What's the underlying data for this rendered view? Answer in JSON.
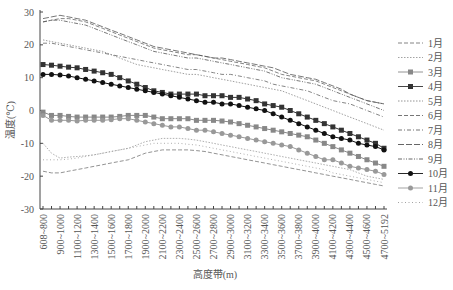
{
  "chart_data": {
    "type": "line",
    "title": "",
    "xlabel": "高度带(m)",
    "ylabel": "温度(℃)",
    "ylim": [
      -30,
      30
    ],
    "yticks": [
      30,
      20,
      10,
      0,
      -10,
      -20,
      -30
    ],
    "grid": false,
    "legend_position": "right",
    "categories": [
      "608~800",
      "800~900",
      "900~1000",
      "1000~1100",
      "1100~1200",
      "1200~1300",
      "1300~1400",
      "1400~1500",
      "1500~1600",
      "1600~1700",
      "1700~1800",
      "1800~1900",
      "1900~2000",
      "2000~2100",
      "2100~2200",
      "2200~2300",
      "2300~2400",
      "2400~2500",
      "2500~2600",
      "2600~2700",
      "2700~2800",
      "2800~2900",
      "2900~3000",
      "3000~3100",
      "3100~3200",
      "3200~3300",
      "3300~3400",
      "3400~3500",
      "3500~3600",
      "3600~3700",
      "3700~3800",
      "3800~3900",
      "3900~4000",
      "4000~4100",
      "4100~4200",
      "4200~4300",
      "4300~4400",
      "4400~4500",
      "4500~4600",
      "4600~4700",
      "4700~5192"
    ],
    "xtick_labels": [
      "608~800",
      "900~1000",
      "1100~1200",
      "1300~1400",
      "1500~1600",
      "1700~1800",
      "1900~2000",
      "2100~2200",
      "2300~2400",
      "2500~2600",
      "2700~2800",
      "2900~3000",
      "3100~3200",
      "3300~3400",
      "3500~3600",
      "3700~3800",
      "3900~4000",
      "4100~4200",
      "4300~4400",
      "4500~4600",
      "4700~5192"
    ],
    "series": [
      {
        "name": "1月",
        "style": "dash",
        "color": "#777777",
        "values": [
          -18.5,
          -19,
          -19,
          -18.5,
          -18,
          -17.5,
          -17,
          -16.5,
          -16,
          -15.5,
          -15,
          -14,
          -13,
          -12.5,
          -12,
          -12,
          -12,
          -12,
          -12.2,
          -12.5,
          -13,
          -13.5,
          -14,
          -14.5,
          -15,
          -15.5,
          -16,
          -16.5,
          -17,
          -17.5,
          -18,
          -18.5,
          -19,
          -19.5,
          -20,
          -20.5,
          -21,
          -21.5,
          -22,
          -22.5,
          -23
        ]
      },
      {
        "name": "2月",
        "style": "dot",
        "color": "#999999",
        "values": [
          -10,
          -13,
          -14.5,
          -14.2,
          -14,
          -13.8,
          -13.5,
          -13,
          -12.5,
          -12,
          -11.5,
          -10.5,
          -9.5,
          -9,
          -8.5,
          -8.5,
          -8.5,
          -8.7,
          -9,
          -9.5,
          -10,
          -10.5,
          -11,
          -11.5,
          -12,
          -12.5,
          -13,
          -13.5,
          -14,
          -14.5,
          -15,
          -15.5,
          -16,
          -16.5,
          -17,
          -17.5,
          -18,
          -19,
          -20,
          -20.5,
          -21
        ]
      },
      {
        "name": "3月",
        "style": "square",
        "color": "#888888",
        "values": [
          -0.5,
          -1.5,
          -1.5,
          -1.8,
          -2,
          -2,
          -2,
          -2,
          -2,
          -1.8,
          -1.5,
          -1.5,
          -1.5,
          -2,
          -2.5,
          -2.5,
          -2.5,
          -2.5,
          -3,
          -3,
          -3,
          -3.2,
          -3.5,
          -4,
          -4.5,
          -5,
          -5.5,
          -6,
          -6.5,
          -7,
          -7.5,
          -8,
          -9,
          -10,
          -11,
          -12,
          -13,
          -14,
          -15,
          -16,
          -17
        ]
      },
      {
        "name": "4月",
        "style": "square",
        "color": "#333333",
        "values": [
          14,
          13.8,
          13.5,
          13.2,
          13,
          12.5,
          12,
          11.5,
          11,
          10,
          9,
          8,
          7,
          6,
          5.5,
          5,
          5,
          5,
          5,
          4.5,
          4.5,
          4.5,
          4,
          4,
          3.5,
          3,
          2,
          1.5,
          1,
          0,
          -1,
          -2,
          -3,
          -4,
          -5,
          -6,
          -7,
          -8,
          -9,
          -10,
          -11.5
        ]
      },
      {
        "name": "5月",
        "style": "dot",
        "color": "#888888",
        "values": [
          21.5,
          21,
          20.5,
          20,
          19.5,
          19,
          18.5,
          18,
          17,
          16,
          15,
          14,
          13.5,
          13,
          12.5,
          12,
          11.5,
          11,
          11,
          10.5,
          10,
          9.5,
          9,
          8.5,
          8,
          7.5,
          7,
          6.5,
          6,
          5,
          4,
          3,
          2,
          1,
          0,
          -1,
          -2,
          -3,
          -4,
          -5,
          -6
        ]
      },
      {
        "name": "6月",
        "style": "dash",
        "color": "#666666",
        "values": [
          27,
          27.5,
          28,
          28,
          27.5,
          27,
          26,
          25,
          24,
          23,
          22,
          21,
          20,
          19,
          18.5,
          18,
          17.5,
          17,
          17,
          16.5,
          16,
          15.5,
          15,
          14.5,
          14,
          13.5,
          13,
          12,
          11,
          10.5,
          10,
          9.5,
          9,
          8,
          7,
          6,
          5,
          4,
          3,
          2.5,
          2
        ]
      },
      {
        "name": "7月",
        "style": "dashdot",
        "color": "#666666",
        "values": [
          20.5,
          20.5,
          20,
          19.5,
          19,
          18.5,
          18,
          17.5,
          17,
          16.5,
          16,
          15.5,
          15,
          14.5,
          14,
          13.5,
          13,
          12.5,
          12.5,
          12,
          11.5,
          11,
          11,
          10.5,
          10,
          9.5,
          9,
          8,
          7.5,
          7,
          6.5,
          6,
          5,
          4,
          3,
          2.5,
          2,
          1,
          0,
          -1,
          -2
        ]
      },
      {
        "name": "8月",
        "style": "longdash",
        "color": "#555555",
        "values": [
          28,
          28.5,
          29,
          28.5,
          28,
          27.5,
          26.5,
          25.5,
          24.5,
          23.5,
          22.5,
          21.5,
          20.5,
          19.5,
          19,
          18.5,
          18,
          17.5,
          17,
          16.5,
          16,
          16,
          15.5,
          15,
          14.5,
          14,
          13.5,
          13,
          12,
          11,
          10.5,
          10,
          9.5,
          8.5,
          7.5,
          6.5,
          5,
          4,
          3,
          2.5,
          2
        ]
      },
      {
        "name": "9月",
        "style": "dashdotdot",
        "color": "#555555",
        "values": [
          27,
          27.5,
          27.5,
          27,
          26.5,
          26,
          25,
          24,
          23,
          22,
          21,
          20,
          19,
          18,
          17.5,
          17,
          16.5,
          16,
          16,
          15.5,
          15,
          14.5,
          14,
          13.5,
          13,
          12.5,
          12,
          11,
          10,
          9.5,
          9,
          8.5,
          8,
          7,
          6,
          5,
          4,
          3,
          2,
          1,
          0
        ]
      },
      {
        "name": "10月",
        "style": "circle",
        "color": "#111111",
        "values": [
          11,
          11,
          10.8,
          10.5,
          10,
          9.5,
          9,
          8.5,
          8,
          7.5,
          7,
          6.5,
          6,
          5.5,
          5,
          4.5,
          4,
          3.5,
          3,
          2.5,
          2.5,
          2,
          2,
          1.5,
          1,
          0.5,
          0,
          -1,
          -2,
          -3,
          -4,
          -5,
          -6,
          -7,
          -8,
          -8.5,
          -9,
          -10,
          -10.5,
          -11,
          -12
        ]
      },
      {
        "name": "11月",
        "style": "circle",
        "color": "#999999",
        "values": [
          -1.5,
          -3,
          -3,
          -3,
          -3.2,
          -3,
          -3,
          -3,
          -2.8,
          -2.5,
          -2.5,
          -3,
          -3.5,
          -4,
          -4.5,
          -5,
          -5,
          -5.5,
          -6,
          -6,
          -6.5,
          -7,
          -7.5,
          -8,
          -8.5,
          -9,
          -9.5,
          -10,
          -10.5,
          -11,
          -12,
          -13,
          -14,
          -15,
          -15,
          -16,
          -17,
          -17.5,
          -18,
          -18.5,
          -19.5
        ]
      },
      {
        "name": "12月",
        "style": "dotsparse",
        "color": "#999999",
        "values": [
          -15,
          -15,
          -15,
          -14.8,
          -14.5,
          -14,
          -13.5,
          -13,
          -12.5,
          -12,
          -11.5,
          -11,
          -10.5,
          -10,
          -10,
          -10,
          -10,
          -10.3,
          -10.5,
          -11,
          -11.5,
          -12,
          -12.5,
          -13,
          -13.5,
          -14,
          -14.5,
          -15,
          -15.5,
          -16,
          -16.5,
          -17,
          -17.5,
          -18,
          -19,
          -19.5,
          -20,
          -20.5,
          -21,
          -21.5,
          -22
        ]
      }
    ]
  }
}
